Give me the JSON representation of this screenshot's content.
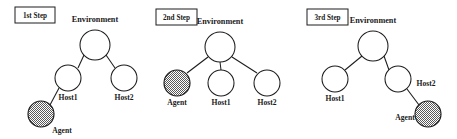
{
  "figure": {
    "caption": "Agent migration across hosts in an environment tree, shown in three sequential steps",
    "background_color": "#ffffff",
    "line_color": "#1c1c1c",
    "text_color": "#1a1a1a",
    "agent_fill_pattern": "checkered-gray",
    "agent_fill_color": "#8c8c8c"
  },
  "panels": [
    {
      "id": "panel-1",
      "step_label": "1st Step",
      "root_label": "Environment",
      "nodes": [
        {
          "name": "environment",
          "label": "Environment",
          "type": "open",
          "cx": 95,
          "cy": 45,
          "r": 15,
          "label_x": 95,
          "label_y": 22,
          "label_anchor": "middle"
        },
        {
          "name": "host1",
          "label": "Host1",
          "type": "open",
          "cx": 68,
          "cy": 78,
          "r": 13,
          "label_x": 68,
          "label_y": 100,
          "label_anchor": "middle"
        },
        {
          "name": "host2",
          "label": "Host2",
          "type": "open",
          "cx": 124,
          "cy": 78,
          "r": 13,
          "label_x": 124,
          "label_y": 100,
          "label_anchor": "middle"
        },
        {
          "name": "agent",
          "label": "Agent",
          "type": "filled",
          "cx": 41,
          "cy": 114,
          "r": 13,
          "label_x": 62,
          "label_y": 133,
          "label_anchor": "middle"
        }
      ],
      "edges": [
        {
          "from": "environment",
          "to": "host1",
          "x1": 84,
          "y1": 55,
          "x2": 78,
          "y2": 68
        },
        {
          "from": "environment",
          "to": "host2",
          "x1": 106,
          "y1": 55,
          "x2": 115,
          "y2": 68
        },
        {
          "from": "host1",
          "to": "agent",
          "x1": 59,
          "y1": 88,
          "x2": 50,
          "y2": 105
        }
      ]
    },
    {
      "id": "panel-2",
      "step_label": "2nd Step",
      "root_label": "Environment",
      "nodes": [
        {
          "name": "environment",
          "label": "Environment",
          "type": "open",
          "cx": 68,
          "cy": 47,
          "r": 15,
          "label_x": 68,
          "label_y": 24,
          "label_anchor": "middle"
        },
        {
          "name": "agent",
          "label": "Agent",
          "type": "filled",
          "cx": 25,
          "cy": 83,
          "r": 13,
          "label_x": 25,
          "label_y": 105,
          "label_anchor": "middle"
        },
        {
          "name": "host1",
          "label": "Host1",
          "type": "open",
          "cx": 69,
          "cy": 83,
          "r": 13,
          "label_x": 69,
          "label_y": 105,
          "label_anchor": "middle"
        },
        {
          "name": "host2",
          "label": "Host2",
          "type": "open",
          "cx": 115,
          "cy": 83,
          "r": 13,
          "label_x": 115,
          "label_y": 105,
          "label_anchor": "middle"
        }
      ],
      "edges": [
        {
          "from": "environment",
          "to": "agent",
          "x1": 56,
          "y1": 57,
          "x2": 35,
          "y2": 73
        },
        {
          "from": "environment",
          "to": "host1",
          "x1": 68,
          "y1": 62,
          "x2": 69,
          "y2": 70
        },
        {
          "from": "environment",
          "to": "host2",
          "x1": 80,
          "y1": 57,
          "x2": 105,
          "y2": 73
        }
      ]
    },
    {
      "id": "panel-3",
      "step_label": "3rd Step",
      "root_label": "Environment",
      "nodes": [
        {
          "name": "environment",
          "label": "Environment",
          "type": "open",
          "cx": 71,
          "cy": 46,
          "r": 15,
          "label_x": 71,
          "label_y": 23,
          "label_anchor": "middle"
        },
        {
          "name": "host1",
          "label": "Host1",
          "type": "open",
          "cx": 33,
          "cy": 79,
          "r": 13,
          "label_x": 33,
          "label_y": 101,
          "label_anchor": "middle"
        },
        {
          "name": "host2",
          "label": "Host2",
          "type": "open",
          "cx": 96,
          "cy": 79,
          "r": 13,
          "label_x": 124,
          "label_y": 86,
          "label_anchor": "middle"
        },
        {
          "name": "agent",
          "label": "Agent",
          "type": "filled",
          "cx": 126,
          "cy": 114,
          "r": 13,
          "label_x": 103,
          "label_y": 120,
          "label_anchor": "middle"
        }
      ],
      "edges": [
        {
          "from": "environment",
          "to": "host1",
          "x1": 60,
          "y1": 56,
          "x2": 43,
          "y2": 70
        },
        {
          "from": "environment",
          "to": "host2",
          "x1": 82,
          "y1": 56,
          "x2": 87,
          "y2": 70
        },
        {
          "from": "host2",
          "to": "agent",
          "x1": 105,
          "y1": 89,
          "x2": 117,
          "y2": 105
        }
      ]
    }
  ]
}
